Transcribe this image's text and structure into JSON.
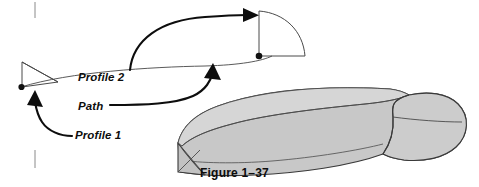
{
  "figure": {
    "caption": "Figure 1–37",
    "width": 479,
    "height": 187,
    "background_color": "#ffffff",
    "line_color": "#0d0d0d",
    "thin_line_color": "#555555",
    "solid_fill_color": "#c8c8c8",
    "solid_fill_shadow_color": "#b4b4b4",
    "solid_edge_color": "#3a3a3a"
  },
  "callouts": [
    {
      "id": "profile-2",
      "label": "Profile 2",
      "target": "right-profile-quarter-circle"
    },
    {
      "id": "path",
      "label": "Path",
      "target": "sweep-path-curve"
    },
    {
      "id": "profile-1",
      "label": "Profile 1",
      "target": "left-profile-triangle"
    }
  ],
  "geometry": {
    "left_profile": {
      "name": "Profile 1",
      "shape": "triangle",
      "vertex_marker": "dot"
    },
    "right_profile": {
      "name": "Profile 2",
      "shape": "quarter-circle",
      "vertex_marker": "dot"
    },
    "path": {
      "name": "Path",
      "shape": "curve"
    },
    "result_solid": {
      "name": "swept-solid",
      "shape": "lofted-sweep-body"
    }
  },
  "crop_marks": [
    {
      "id": "crop-mark-top-left"
    },
    {
      "id": "crop-mark-bottom-left"
    }
  ]
}
